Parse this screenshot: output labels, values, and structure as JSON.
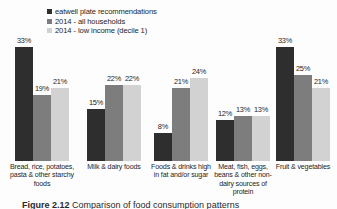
{
  "chart_data": {
    "type": "bar",
    "title": "",
    "subtitle": "",
    "xlabel": "",
    "ylabel": "",
    "ylim": [
      0,
      35
    ],
    "grid": false,
    "legend_position": "top-left-inside",
    "value_label_suffix": "%",
    "categories": [
      "Bread, rice, potatoes, pasta & other starchy foods",
      "Milk & dairy foods",
      "Foods & drinks high in fat and/or sugar",
      "Meat, fish, eggs, beans & other non-dairy sources of protein",
      "Fruit & vegetables"
    ],
    "series": [
      {
        "name": "eatwell plate recommendations",
        "color": "#2e2e2e",
        "values": [
          33,
          15,
          8,
          12,
          33
        ],
        "labels": [
          "33%",
          "15%",
          "8%",
          "12%",
          "33%"
        ]
      },
      {
        "name": "2014 - all households",
        "color": "#7d7d7d",
        "values": [
          19,
          22,
          21,
          13,
          25
        ],
        "labels": [
          "19%",
          "22%",
          "21%",
          "13%",
          "25%"
        ]
      },
      {
        "name": "2014 - low income (decile 1)",
        "color": "#d2d2d2",
        "values": [
          21,
          22,
          24,
          13,
          21
        ],
        "labels": [
          "21%",
          "22%",
          "24%",
          "13%",
          "21%"
        ]
      }
    ]
  },
  "legend": {
    "items": [
      {
        "label": "eatwell plate recommendations",
        "color": "#2e2e2e"
      },
      {
        "label": "2014 - all households",
        "color": "#7d7d7d"
      },
      {
        "label": "2014 - low income (decile 1)",
        "color": "#d2d2d2"
      }
    ]
  },
  "caption": {
    "number": "Figure 2.12",
    "text": "Comparison of food consumption patterns"
  }
}
